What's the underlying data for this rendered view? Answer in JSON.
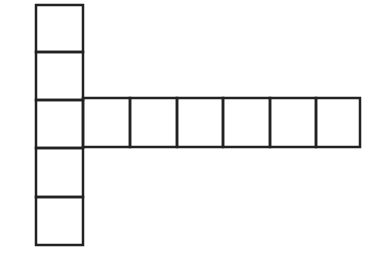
{
  "diagram": {
    "type": "cube-net",
    "stroke_color": "#222222",
    "background": "#ffffff",
    "cell_size": 47,
    "vertical_column": {
      "x": 36,
      "rows_y": [
        5,
        52,
        100,
        148,
        197,
        245
      ],
      "cell_count": 5
    },
    "horizontal_row": {
      "y_top": 98,
      "y_bottom": 147,
      "columns_x": [
        83,
        130,
        177,
        223,
        270,
        316,
        360
      ],
      "cell_count": 6
    }
  }
}
